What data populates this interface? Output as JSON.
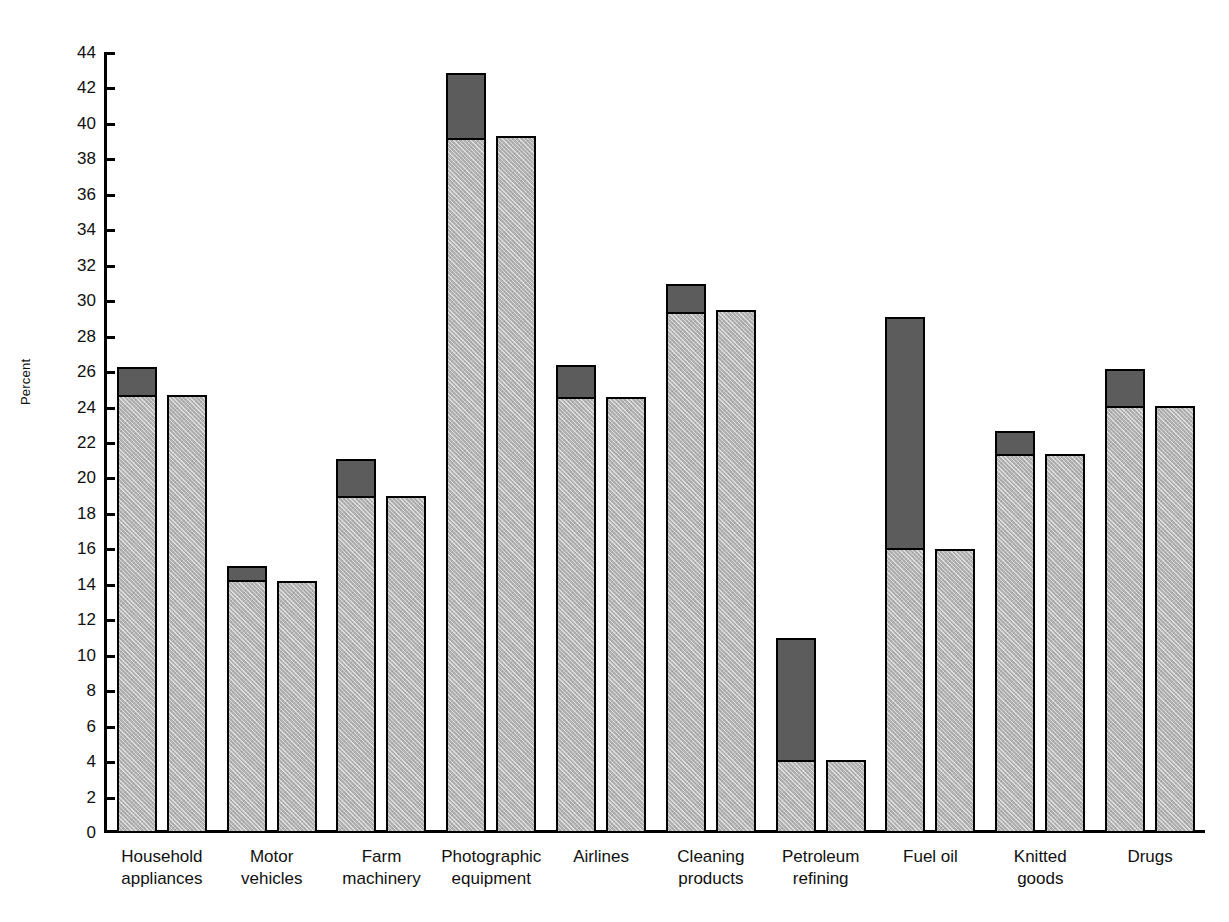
{
  "chart_data": {
    "type": "bar",
    "title": "",
    "subtitle": "",
    "xlabel": "",
    "ylabel": "Percent",
    "ylim": [
      0,
      44
    ],
    "ytick_step": 2,
    "yticks": [
      0,
      2,
      4,
      6,
      8,
      10,
      12,
      14,
      16,
      18,
      20,
      22,
      24,
      26,
      28,
      30,
      32,
      34,
      36,
      38,
      40,
      42,
      44
    ],
    "grid": false,
    "legend": "none",
    "categories": [
      "Household appliances",
      "Motor vehicles",
      "Farm machinery",
      "Photographic equipment",
      "Airlines",
      "Cleaning products",
      "Petroleum refining",
      "Fuel oil",
      "Knitted goods",
      "Drugs"
    ],
    "category_lines": [
      [
        "Household",
        "appliances"
      ],
      [
        "Motor",
        "vehicles"
      ],
      [
        "Farm",
        "machinery"
      ],
      [
        "Photographic",
        "equipment"
      ],
      [
        "Airlines"
      ],
      [
        "Cleaning",
        "products"
      ],
      [
        "Petroleum",
        "refining"
      ],
      [
        "Fuel oil"
      ],
      [
        "Knitted",
        "goods"
      ],
      [
        "Drugs"
      ]
    ],
    "series": [
      {
        "name": "bar-1-light-base",
        "values": [
          24.7,
          14.3,
          19.0,
          39.2,
          24.6,
          29.4,
          4.1,
          16.1,
          21.4,
          24.1
        ]
      },
      {
        "name": "bar-1-dark-top",
        "values": [
          26.4,
          15.2,
          21.2,
          43.0,
          26.5,
          31.1,
          11.1,
          29.2,
          22.8,
          26.3
        ]
      },
      {
        "name": "bar-2-light",
        "values": [
          24.7,
          14.2,
          19.0,
          39.3,
          24.6,
          29.5,
          4.1,
          16.0,
          21.4,
          24.1
        ]
      }
    ],
    "colors": {
      "light_fill": "#b3b3b3",
      "dark_fill": "#5c5c5c",
      "outline": "#000000",
      "background": "#ffffff"
    }
  }
}
